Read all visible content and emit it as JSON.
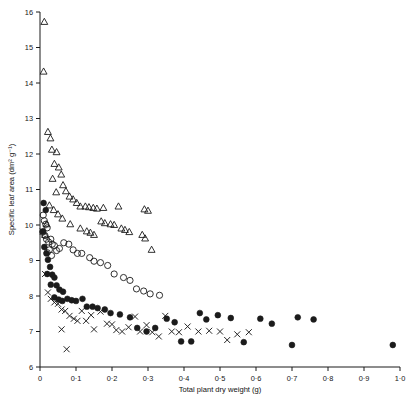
{
  "chart_data": {
    "type": "scatter",
    "title": "",
    "xlabel": "Total plant dry weight (g)",
    "ylabel": "Specific leaf area (dm² g⁻¹)",
    "xlim": [
      0,
      1.0
    ],
    "ylim": [
      6,
      16
    ],
    "grid": false,
    "legend": "none",
    "xticks": [
      {
        "value": 0,
        "label": "0"
      },
      {
        "value": 0.1,
        "label": "0·1"
      },
      {
        "value": 0.2,
        "label": "0·2"
      },
      {
        "value": 0.3,
        "label": "0·3"
      },
      {
        "value": 0.4,
        "label": "0·4"
      },
      {
        "value": 0.5,
        "label": "0·5"
      },
      {
        "value": 0.6,
        "label": "0·6"
      },
      {
        "value": 0.7,
        "label": "0·7"
      },
      {
        "value": 0.8,
        "label": "0·8"
      },
      {
        "value": 0.9,
        "label": "0·9"
      },
      {
        "value": 1.0,
        "label": "1·0"
      }
    ],
    "yticks": [
      {
        "value": 6,
        "label": "6"
      },
      {
        "value": 7,
        "label": "7"
      },
      {
        "value": 8,
        "label": "8"
      },
      {
        "value": 9,
        "label": "9"
      },
      {
        "value": 10,
        "label": "10"
      },
      {
        "value": 11,
        "label": "11"
      },
      {
        "value": 12,
        "label": "12"
      },
      {
        "value": 13,
        "label": "13"
      },
      {
        "value": 14,
        "label": "14"
      },
      {
        "value": 15,
        "label": "15"
      },
      {
        "value": 16,
        "label": "16"
      }
    ],
    "series": [
      {
        "name": "triangle",
        "marker": "triangle",
        "points": [
          [
            0.012,
            15.72
          ],
          [
            0.01,
            14.32
          ],
          [
            0.022,
            12.62
          ],
          [
            0.029,
            12.44
          ],
          [
            0.033,
            12.12
          ],
          [
            0.046,
            12.05
          ],
          [
            0.04,
            11.72
          ],
          [
            0.052,
            11.62
          ],
          [
            0.059,
            11.42
          ],
          [
            0.035,
            11.3
          ],
          [
            0.064,
            11.12
          ],
          [
            0.072,
            10.95
          ],
          [
            0.045,
            10.92
          ],
          [
            0.082,
            10.8
          ],
          [
            0.092,
            10.72
          ],
          [
            0.102,
            10.62
          ],
          [
            0.112,
            10.52
          ],
          [
            0.126,
            10.52
          ],
          [
            0.136,
            10.5
          ],
          [
            0.148,
            10.48
          ],
          [
            0.158,
            10.46
          ],
          [
            0.176,
            10.48
          ],
          [
            0.218,
            10.52
          ],
          [
            0.29,
            10.44
          ],
          [
            0.3,
            10.4
          ],
          [
            0.17,
            10.1
          ],
          [
            0.18,
            10.05
          ],
          [
            0.196,
            10.02
          ],
          [
            0.206,
            10.0
          ],
          [
            0.226,
            9.9
          ],
          [
            0.236,
            9.86
          ],
          [
            0.248,
            9.8
          ],
          [
            0.13,
            9.82
          ],
          [
            0.14,
            9.78
          ],
          [
            0.15,
            9.72
          ],
          [
            0.112,
            9.9
          ],
          [
            0.084,
            10.02
          ],
          [
            0.062,
            10.18
          ],
          [
            0.05,
            10.3
          ],
          [
            0.038,
            10.42
          ],
          [
            0.026,
            10.55
          ],
          [
            0.018,
            10.02
          ],
          [
            0.014,
            9.72
          ],
          [
            0.284,
            9.72
          ],
          [
            0.292,
            9.62
          ],
          [
            0.31,
            9.3
          ]
        ]
      },
      {
        "name": "open-circle",
        "marker": "open-circle",
        "points": [
          [
            0.009,
            10.28
          ],
          [
            0.012,
            10.12
          ],
          [
            0.016,
            10.02
          ],
          [
            0.02,
            9.92
          ],
          [
            0.008,
            9.8
          ],
          [
            0.014,
            9.7
          ],
          [
            0.018,
            9.6
          ],
          [
            0.024,
            9.52
          ],
          [
            0.03,
            9.6
          ],
          [
            0.034,
            9.46
          ],
          [
            0.04,
            9.42
          ],
          [
            0.026,
            9.3
          ],
          [
            0.02,
            9.22
          ],
          [
            0.032,
            9.14
          ],
          [
            0.046,
            9.28
          ],
          [
            0.054,
            9.34
          ],
          [
            0.066,
            9.5
          ],
          [
            0.08,
            9.46
          ],
          [
            0.092,
            9.3
          ],
          [
            0.104,
            9.2
          ],
          [
            0.116,
            9.2
          ],
          [
            0.138,
            9.08
          ],
          [
            0.15,
            8.98
          ],
          [
            0.168,
            8.94
          ],
          [
            0.188,
            8.86
          ],
          [
            0.206,
            8.62
          ],
          [
            0.232,
            8.52
          ],
          [
            0.25,
            8.44
          ],
          [
            0.268,
            8.2
          ],
          [
            0.288,
            8.14
          ],
          [
            0.306,
            8.06
          ],
          [
            0.332,
            8.02
          ]
        ]
      },
      {
        "name": "filled-circle",
        "marker": "filled-circle",
        "points": [
          [
            0.01,
            10.62
          ],
          [
            0.016,
            10.42
          ],
          [
            0.008,
            9.82
          ],
          [
            0.012,
            9.38
          ],
          [
            0.018,
            9.2
          ],
          [
            0.022,
            9.02
          ],
          [
            0.028,
            8.82
          ],
          [
            0.02,
            8.62
          ],
          [
            0.034,
            8.6
          ],
          [
            0.04,
            8.52
          ],
          [
            0.03,
            8.32
          ],
          [
            0.046,
            8.3
          ],
          [
            0.054,
            8.18
          ],
          [
            0.064,
            8.12
          ],
          [
            0.04,
            7.96
          ],
          [
            0.052,
            7.9
          ],
          [
            0.062,
            7.86
          ],
          [
            0.076,
            7.92
          ],
          [
            0.088,
            7.88
          ],
          [
            0.1,
            7.86
          ],
          [
            0.118,
            7.92
          ],
          [
            0.13,
            7.7
          ],
          [
            0.146,
            7.7
          ],
          [
            0.16,
            7.66
          ],
          [
            0.18,
            7.62
          ],
          [
            0.196,
            7.52
          ],
          [
            0.222,
            7.48
          ],
          [
            0.25,
            7.4
          ],
          [
            0.27,
            7.1
          ],
          [
            0.296,
            7.0
          ],
          [
            0.32,
            7.1
          ],
          [
            0.352,
            7.36
          ],
          [
            0.374,
            7.26
          ],
          [
            0.392,
            6.72
          ],
          [
            0.42,
            6.72
          ],
          [
            0.444,
            7.52
          ],
          [
            0.462,
            7.34
          ],
          [
            0.494,
            7.46
          ],
          [
            0.53,
            7.38
          ],
          [
            0.566,
            6.7
          ],
          [
            0.612,
            7.36
          ],
          [
            0.644,
            7.22
          ],
          [
            0.7,
            6.62
          ],
          [
            0.716,
            7.4
          ],
          [
            0.76,
            7.34
          ],
          [
            0.98,
            6.62
          ]
        ]
      },
      {
        "name": "cross",
        "marker": "cross",
        "points": [
          [
            0.008,
            9.82
          ],
          [
            0.014,
            8.62
          ],
          [
            0.022,
            8.1
          ],
          [
            0.03,
            7.92
          ],
          [
            0.04,
            7.82
          ],
          [
            0.05,
            7.78
          ],
          [
            0.06,
            7.62
          ],
          [
            0.07,
            7.58
          ],
          [
            0.082,
            7.44
          ],
          [
            0.094,
            7.36
          ],
          [
            0.104,
            7.3
          ],
          [
            0.06,
            7.06
          ],
          [
            0.074,
            6.5
          ],
          [
            0.116,
            7.58
          ],
          [
            0.128,
            7.3
          ],
          [
            0.142,
            7.46
          ],
          [
            0.15,
            7.06
          ],
          [
            0.168,
            7.56
          ],
          [
            0.186,
            7.22
          ],
          [
            0.2,
            7.2
          ],
          [
            0.212,
            7.04
          ],
          [
            0.228,
            7.0
          ],
          [
            0.246,
            7.12
          ],
          [
            0.264,
            7.42
          ],
          [
            0.278,
            7.0
          ],
          [
            0.296,
            7.18
          ],
          [
            0.312,
            6.98
          ],
          [
            0.33,
            6.86
          ],
          [
            0.348,
            7.44
          ],
          [
            0.366,
            7.0
          ],
          [
            0.386,
            6.98
          ],
          [
            0.41,
            7.14
          ],
          [
            0.44,
            7.0
          ],
          [
            0.47,
            7.02
          ],
          [
            0.5,
            7.0
          ],
          [
            0.52,
            6.76
          ],
          [
            0.548,
            6.92
          ],
          [
            0.58,
            6.98
          ]
        ]
      }
    ]
  }
}
